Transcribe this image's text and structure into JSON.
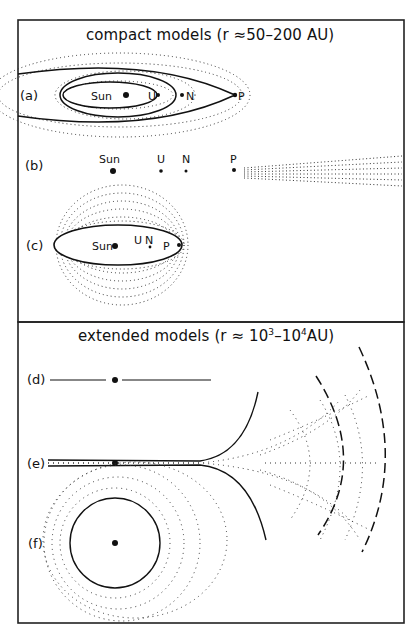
{
  "header": {
    "running_head": ""
  },
  "panels": {
    "compact": {
      "title": "compact models (r ≈50–200 AU)",
      "rows": [
        {
          "id": "a",
          "label": "(a)",
          "bodies": [
            "Sun",
            "U",
            "N",
            "P"
          ],
          "description": "nested elliptical orbits with dotted halos"
        },
        {
          "id": "b",
          "label": "(b)",
          "bodies": [
            "Sun",
            "U",
            "N",
            "P"
          ],
          "description": "aligned bodies with dotted disk beyond P"
        },
        {
          "id": "c",
          "label": "(c)",
          "bodies": [
            "Sun",
            "U",
            "N",
            "P"
          ],
          "description": "ellipse within spherical dotted cloud"
        }
      ]
    },
    "extended": {
      "title_prefix": "extended models (r ≈ 10",
      "title_exp1": "3",
      "title_mid": "–10",
      "title_exp2": "4",
      "title_suffix": "AU)",
      "rows": [
        {
          "id": "d",
          "label": "(d)",
          "description": "thin line through central body"
        },
        {
          "id": "e",
          "label": "(e)",
          "description": "flaring dotted disk with dashed outer arcs"
        },
        {
          "id": "f",
          "label": "(f)",
          "description": "circle around central body with dotted cloud"
        }
      ]
    }
  },
  "colors": {
    "ink": "#111111",
    "background": "#ffffff",
    "frame": "#222222"
  }
}
